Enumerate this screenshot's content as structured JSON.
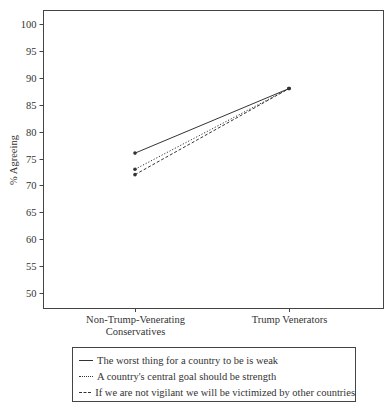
{
  "chart_data": {
    "type": "line",
    "title": "",
    "xlabel": "",
    "ylabel": "% Agreeing",
    "ylim": [
      47,
      102
    ],
    "yticks": [
      50,
      55,
      60,
      65,
      70,
      75,
      80,
      85,
      90,
      95,
      100
    ],
    "grid": false,
    "legend_position": "bottom",
    "categories": [
      "Non-Trump-Venerating Conservatives",
      "Trump Venerators"
    ],
    "category_lines": [
      [
        "Non-Trump-Venerating",
        "Conservatives"
      ],
      [
        "Trump Venerators"
      ]
    ],
    "series": [
      {
        "name": "The worst thing for a country to be is weak",
        "values": [
          76,
          88
        ],
        "line_style": "solid"
      },
      {
        "name": "A country's central goal should be strength",
        "values": [
          73,
          88
        ],
        "line_style": "dotted"
      },
      {
        "name": "If we are not vigilant we will be victimized by other countries",
        "values": [
          72,
          88
        ],
        "line_style": "dashed"
      }
    ]
  },
  "colors": {
    "line": "#333333",
    "axis": "#444444",
    "background": "#ffffff"
  }
}
